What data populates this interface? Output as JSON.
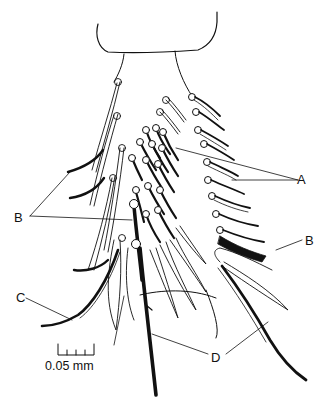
{
  "figure": {
    "background": "#ffffff",
    "ink": "#111111"
  },
  "labels": {
    "a": "A",
    "b_left": "B",
    "b_right": "B",
    "c": "C",
    "d": "D"
  },
  "scale_bar": {
    "text": "0.05 mm",
    "ticks": 5
  }
}
